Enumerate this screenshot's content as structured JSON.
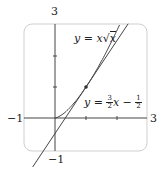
{
  "chart_data": {
    "type": "line",
    "title": "",
    "xlabel": "",
    "ylabel": "",
    "xlim": [
      -1,
      3
    ],
    "ylim": [
      -1,
      3
    ],
    "tick_labels": {
      "x_min": "−1",
      "x_max": "3",
      "y_min": "−1",
      "y_max": "3"
    },
    "grid": false,
    "series": [
      {
        "name": "y = x√x",
        "expr": "x^1.5",
        "x": [
          0,
          0.5,
          1,
          1.5,
          2,
          2.5
        ],
        "y": [
          0,
          0.354,
          1,
          1.837,
          2.828,
          3.953
        ]
      },
      {
        "name": "y = 3/2 x − 1/2",
        "expr": "1.5x - 0.5",
        "x": [
          -0.333,
          0,
          1,
          2,
          2.333
        ],
        "y": [
          -1,
          -0.5,
          1,
          2.5,
          3
        ]
      }
    ],
    "annotations": [
      {
        "type": "point",
        "x": 1,
        "y": 1,
        "label": "tangent point"
      }
    ]
  },
  "labels": {
    "y_top": "3",
    "y_bottom": "−1",
    "x_left": "−1",
    "x_right": "3",
    "curve_eq_prefix": "y = x",
    "curve_eq_sqrt": "x",
    "line_eq_prefix": "y = ",
    "line_frac1_num": "3",
    "line_frac1_den": "2",
    "line_mid": "x − ",
    "line_frac2_num": "1",
    "line_frac2_den": "2"
  }
}
